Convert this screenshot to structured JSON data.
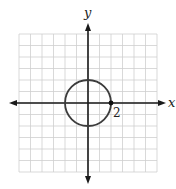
{
  "figure": {
    "x_axis_label": "x",
    "y_axis_label": "y",
    "point_label": "2",
    "colors": {
      "background": "#ffffff",
      "grid": "#cfcfcf",
      "axis": "#1a1a1a",
      "curve": "#3c3c3c",
      "point": "#111111",
      "text": "#222222"
    },
    "grid": {
      "x_min": -6,
      "x_max": 6,
      "y_min": -6,
      "y_max": 6,
      "step": 1
    },
    "curve": {
      "type": "circle",
      "center": [
        0,
        0
      ],
      "radius": 2
    },
    "marked_point": {
      "x": 2,
      "y": 0,
      "label": "2"
    }
  }
}
